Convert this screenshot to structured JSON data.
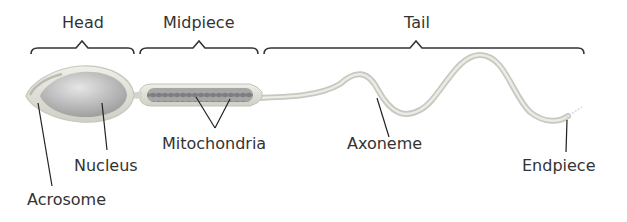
{
  "regions": [
    {
      "label": "Head",
      "x": 62,
      "y": 15
    },
    {
      "label": "Midpiece",
      "x": 163,
      "y": 15
    },
    {
      "label": "Tail",
      "x": 404,
      "y": 15
    }
  ],
  "labels": [
    {
      "label": "Mitochondria",
      "x": 162,
      "y": 136
    },
    {
      "label": "Nucleus",
      "x": 74,
      "y": 158
    },
    {
      "label": "Acrosome",
      "x": 27,
      "y": 192
    },
    {
      "label": "Axoneme",
      "x": 347,
      "y": 136
    },
    {
      "label": "Endpiece",
      "x": 522,
      "y": 158
    }
  ],
  "colors": {
    "bracket": "#333333",
    "leader": "#222222",
    "membrane": "#d8d8d0",
    "nucleus": "#b9b9b9",
    "mitochondria": "#8e8e8e",
    "text": "#333333"
  }
}
